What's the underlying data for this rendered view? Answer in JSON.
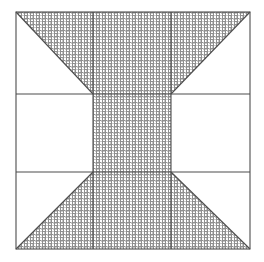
{
  "figure": {
    "type": "geometric-partition-diagram",
    "canvas": {
      "width": 264,
      "height": 262
    },
    "colors": {
      "background": "#ffffff",
      "stroke": "#4d4d4d",
      "hatch_line": "#8a8a8a",
      "hatch_background": "#ffffff",
      "fill_unhatched": "#ffffff"
    },
    "stroke_width": 1.1,
    "hatch": {
      "name": "fine-crosshatch",
      "period_px": 3,
      "line_width_px": 1,
      "orientation_deg": 0,
      "description": "fine woven grid of horizontal and vertical gray lines"
    },
    "outer_square": {
      "x": 16,
      "y": 12,
      "width": 234,
      "height": 237
    },
    "grid_lines": {
      "vertical_x": [
        93,
        171
      ],
      "horizontal_y": [
        94,
        172
      ]
    },
    "cells": [
      {
        "name": "top-left",
        "shape": "triangle",
        "hatched": true,
        "points": "16,12 93,12 93,94"
      },
      {
        "name": "top-center",
        "shape": "rect",
        "hatched": true,
        "points": "93,12 171,12 171,94 93,94"
      },
      {
        "name": "top-right",
        "shape": "triangle",
        "hatched": true,
        "points": "250,12 171,12 171,94"
      },
      {
        "name": "middle-left",
        "shape": "rect",
        "hatched": false,
        "points": "16,94 93,94 93,172 16,172"
      },
      {
        "name": "middle-center",
        "shape": "rect",
        "hatched": true,
        "points": "93,94 171,94 171,172 93,172"
      },
      {
        "name": "middle-right",
        "shape": "rect",
        "hatched": false,
        "points": "171,94 250,94 250,172 171,172"
      },
      {
        "name": "bottom-left",
        "shape": "triangle",
        "hatched": true,
        "points": "16,249 93,249 93,172"
      },
      {
        "name": "bottom-center",
        "shape": "rect",
        "hatched": true,
        "points": "93,172 171,172 171,249 93,249"
      },
      {
        "name": "bottom-right",
        "shape": "triangle",
        "hatched": true,
        "points": "250,249 171,249 171,172"
      }
    ],
    "diagonals": [
      {
        "name": "top-left-diagonal",
        "x1": 16,
        "y1": 12,
        "x2": 93,
        "y2": 94
      },
      {
        "name": "top-right-diagonal",
        "x1": 250,
        "y1": 12,
        "x2": 171,
        "y2": 94
      },
      {
        "name": "bottom-left-diagonal",
        "x1": 16,
        "y1": 249,
        "x2": 93,
        "y2": 172
      },
      {
        "name": "bottom-right-diagonal",
        "x1": 250,
        "y1": 249,
        "x2": 171,
        "y2": 172
      }
    ],
    "labels": {
      "annotations": []
    }
  }
}
